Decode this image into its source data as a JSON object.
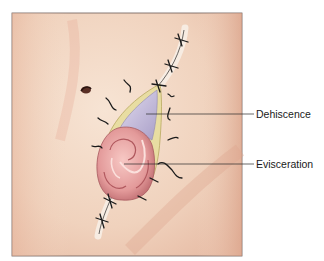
{
  "figure": {
    "labels": [
      {
        "id": "dehiscence",
        "text": "Dehiscence"
      },
      {
        "id": "evisceration",
        "text": "Evisceration"
      }
    ]
  },
  "colors": {
    "skin": "#f3d9c4",
    "skin_shadow": "#e8b8a0",
    "fascia": "#c9c2dc",
    "wound_edge": "#e6dca0",
    "bowel": "#e8a0a0",
    "bowel_dark": "#c46a6e",
    "suture": "#1a1a1a",
    "frame": "#6b5a55"
  }
}
